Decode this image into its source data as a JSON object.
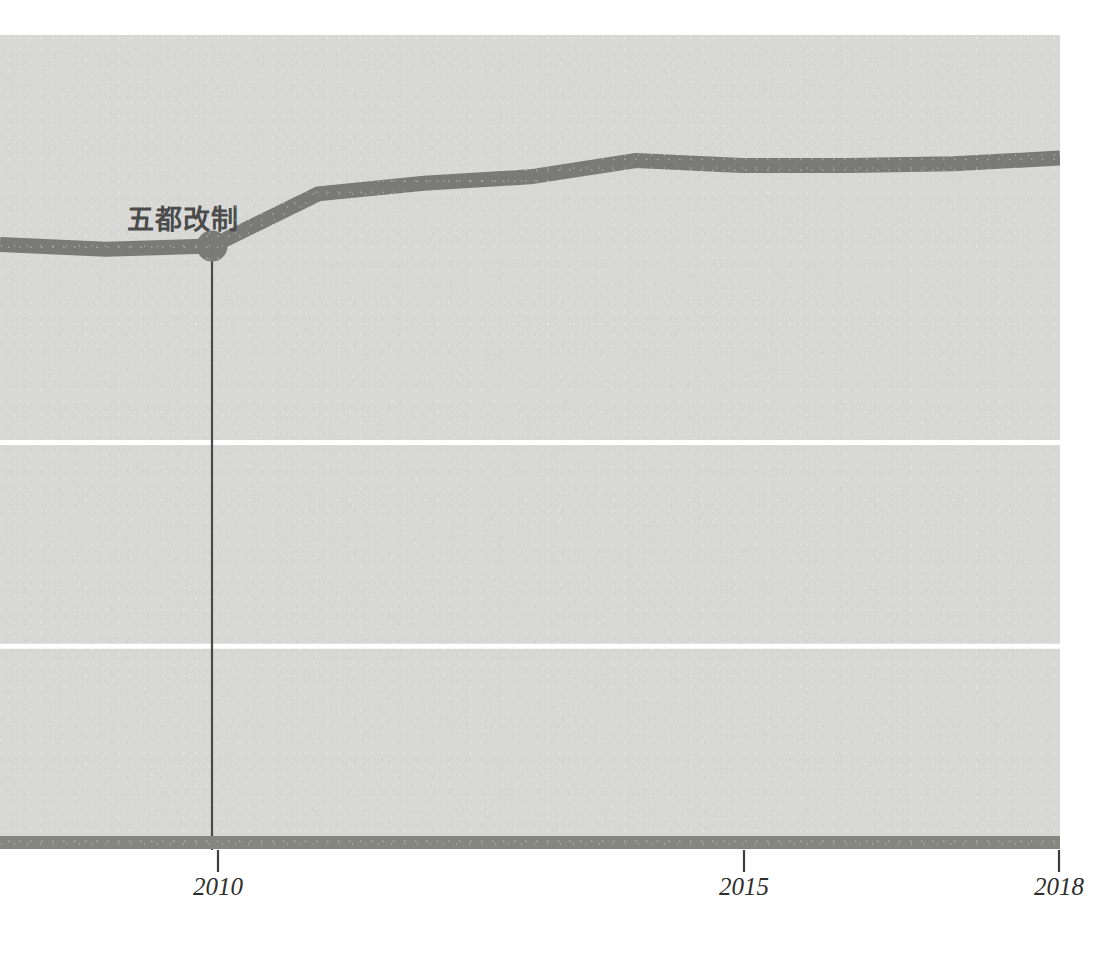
{
  "figure": {
    "background_color": "#ffffff",
    "plot_background_color": "#d7d8d6",
    "line_color": "#7a7b79",
    "gridline_color": "#ffffff",
    "axis_color": "#6e6f6d",
    "label_color": "#4b4b4b"
  },
  "annotation": {
    "event_label": "五都改制",
    "marker_year": 2010
  },
  "axis": {
    "x_ticks": [
      {
        "value": 2010,
        "label": "2010"
      },
      {
        "value": 2015,
        "label": "2015"
      },
      {
        "value": 2018,
        "label": "2018"
      }
    ]
  },
  "chart_data": {
    "type": "line",
    "title": "",
    "xlabel": "",
    "ylabel": "",
    "xlim": [
      2008,
      2018
    ],
    "ylim": [
      0,
      100
    ],
    "grid": true,
    "gridlines_y": [
      50,
      25,
      0
    ],
    "legend": "none",
    "x": [
      2008,
      2009,
      2010,
      2011,
      2012,
      2013,
      2014,
      2015,
      2016,
      2017,
      2018
    ],
    "series": [
      {
        "name": "series-1",
        "values": [
          74.3,
          73.7,
          74.1,
          80.5,
          81.8,
          82.6,
          84.6,
          84.0,
          84.0,
          84.2,
          84.9
        ]
      }
    ],
    "markers": [
      {
        "x": 2010,
        "y": 74.1,
        "label": "五都改制"
      }
    ],
    "annotations": [
      {
        "type": "vline",
        "x": 2010,
        "from_y": 74.1,
        "to_y": 0
      }
    ]
  }
}
